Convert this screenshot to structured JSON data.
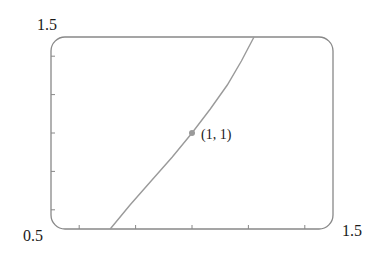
{
  "chart_data": {
    "type": "line",
    "title": "",
    "xlabel": "",
    "ylabel": "",
    "xlim": [
      0.5,
      1.5
    ],
    "ylim": [
      0.5,
      1.5
    ],
    "grid": false,
    "legend": null,
    "corner_labels": {
      "y_max": "1.5",
      "origin": "0.5",
      "x_max": "1.5"
    },
    "x_ticks": [
      0.6,
      0.8,
      1.0,
      1.2,
      1.4
    ],
    "y_ticks": [
      0.6,
      0.8,
      1.0,
      1.2,
      1.4
    ],
    "series": [
      {
        "name": "curve",
        "color": "#9a9a9a",
        "x": [
          0.71,
          0.78,
          0.855,
          0.93,
          1.0,
          1.065,
          1.125,
          1.175,
          1.22
        ],
        "y": [
          0.5,
          0.625,
          0.75,
          0.875,
          1.0,
          1.125,
          1.25,
          1.375,
          1.5
        ]
      }
    ],
    "annotations": [
      {
        "type": "point",
        "x": 1,
        "y": 1,
        "label": "(1, 1)",
        "color": "#9a9a9a"
      }
    ]
  },
  "colors": {
    "frame": "#888888",
    "curve": "#9a9a9a",
    "text": "#1a1a1a"
  }
}
